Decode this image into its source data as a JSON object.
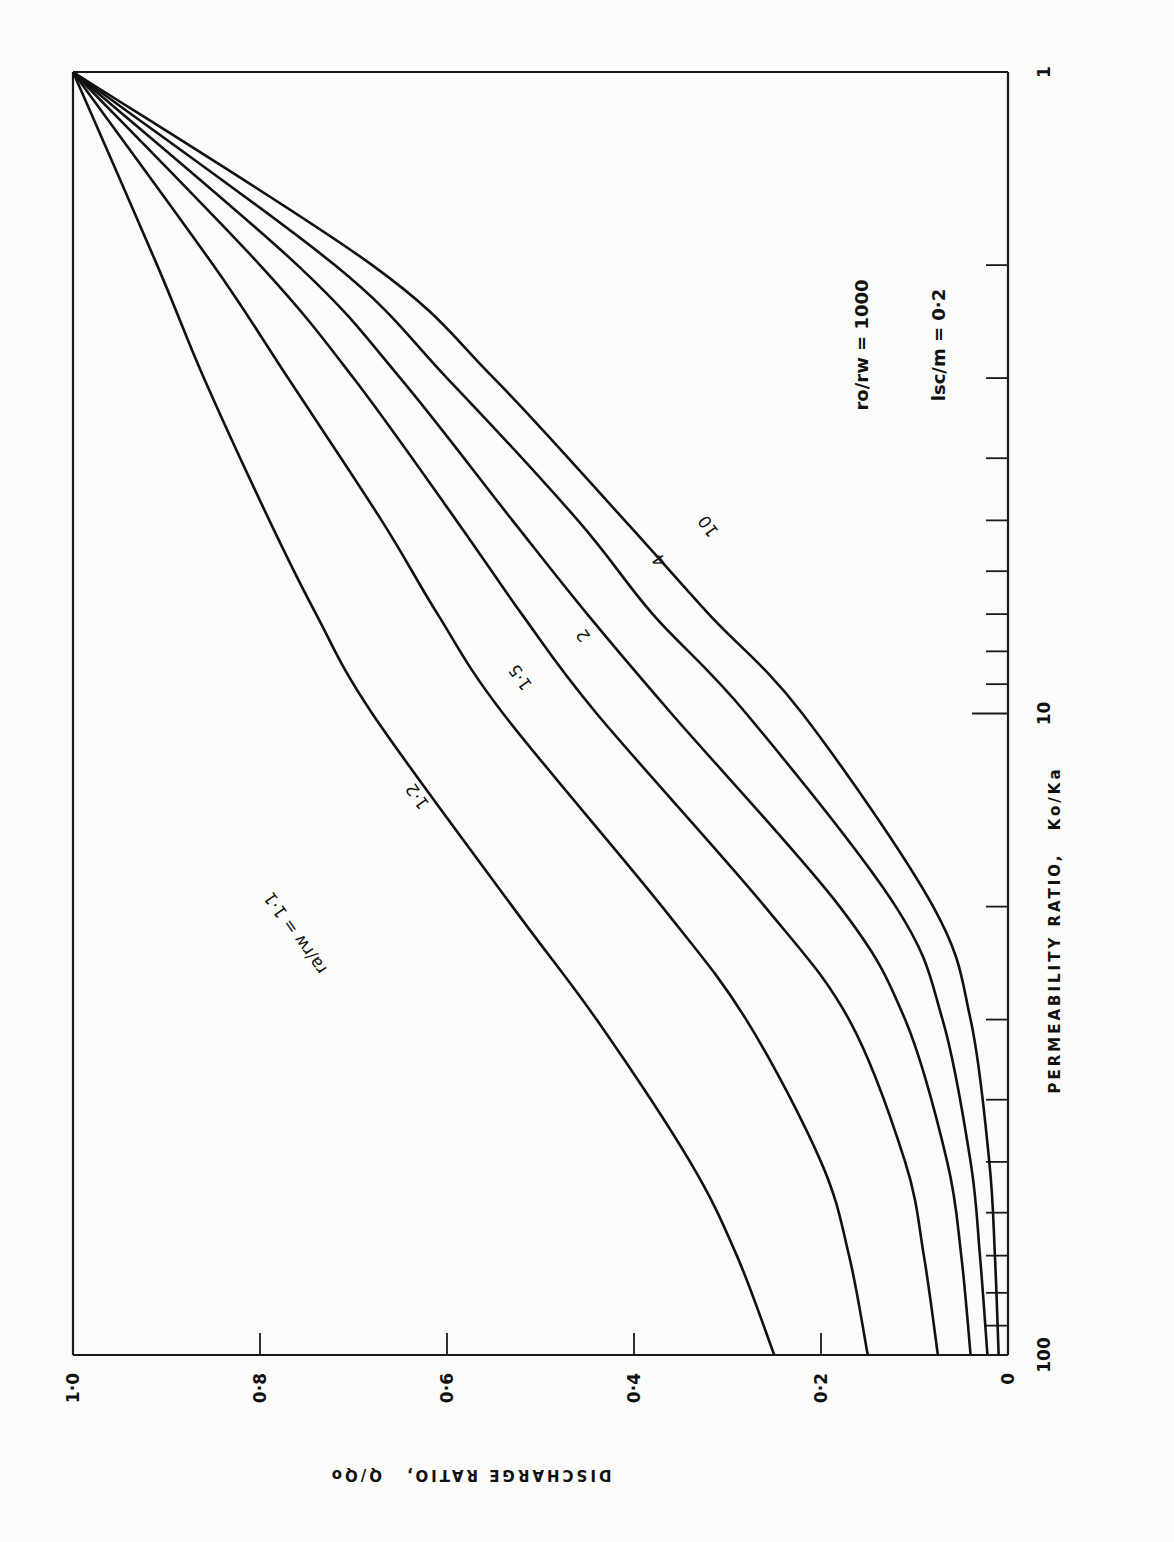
{
  "chart_data": {
    "type": "line",
    "orientation_note": "figure rotated 90deg clockwise on page",
    "title": "",
    "xlabel": "PERMEABILITY RATIO, Ko/Ka",
    "ylabel": "DISCHARGE RATIO, Q/Qo",
    "xscale": "log",
    "xlim": [
      1,
      100
    ],
    "ylim": [
      0,
      1.0
    ],
    "x_tick_labels": [
      "1",
      "10",
      "100"
    ],
    "y_tick_labels": [
      "0",
      "0·2",
      "0·4",
      "0·6",
      "0·8",
      "1·0"
    ],
    "grid": false,
    "annotations": [
      "ro/rw = 1000",
      "lsc/m = 0·2"
    ],
    "x": [
      1,
      2,
      3,
      5,
      7,
      10,
      20,
      30,
      50,
      70,
      100
    ],
    "series": [
      {
        "name": "ra/rw = 1·1",
        "label": "ra/rw = 1·1",
        "values": [
          1.0,
          0.91,
          0.86,
          0.79,
          0.74,
          0.68,
          0.53,
          0.44,
          0.34,
          0.29,
          0.25
        ]
      },
      {
        "name": "1·2",
        "label": "1·2",
        "values": [
          1.0,
          0.85,
          0.77,
          0.67,
          0.61,
          0.54,
          0.37,
          0.28,
          0.2,
          0.17,
          0.15
        ]
      },
      {
        "name": "1·5",
        "label": "1·5",
        "values": [
          1.0,
          0.8,
          0.7,
          0.59,
          0.52,
          0.44,
          0.26,
          0.17,
          0.11,
          0.09,
          0.075
        ]
      },
      {
        "name": "2",
        "label": "2",
        "values": [
          1.0,
          0.76,
          0.65,
          0.53,
          0.45,
          0.36,
          0.18,
          0.11,
          0.065,
          0.05,
          0.04
        ]
      },
      {
        "name": "4",
        "label": "4",
        "values": [
          1.0,
          0.72,
          0.6,
          0.46,
          0.38,
          0.28,
          0.12,
          0.07,
          0.04,
          0.03,
          0.022
        ]
      },
      {
        "name": "10",
        "label": "10",
        "values": [
          1.0,
          0.68,
          0.55,
          0.41,
          0.32,
          0.22,
          0.08,
          0.04,
          0.02,
          0.014,
          0.01
        ]
      }
    ]
  },
  "axes": {
    "y_ticks": [
      {
        "label": "1·0",
        "value": 1.0
      },
      {
        "label": "0·8",
        "value": 0.8
      },
      {
        "label": "0·6",
        "value": 0.6
      },
      {
        "label": "0·4",
        "value": 0.4
      },
      {
        "label": "0·2",
        "value": 0.2
      },
      {
        "label": "0",
        "value": 0.0
      }
    ],
    "x_labeled_ticks": [
      {
        "label": "1",
        "value": 1
      },
      {
        "label": "10",
        "value": 10
      },
      {
        "label": "100",
        "value": 100
      }
    ],
    "x_title": "PERMEABILITY RATIO,",
    "x_title_sym": "Ko/Ka",
    "y_title": "DISCHARGE RATIO,",
    "y_title_sym": "Q/Qo"
  },
  "annotations": {
    "ratio_rw": "ro/rw = 1000",
    "ratio_lsc": "lsc/m = 0·2"
  },
  "curve_labels": [
    "ra/rw = 1·1",
    "1·2",
    "1·5",
    "2",
    "4",
    "10"
  ]
}
